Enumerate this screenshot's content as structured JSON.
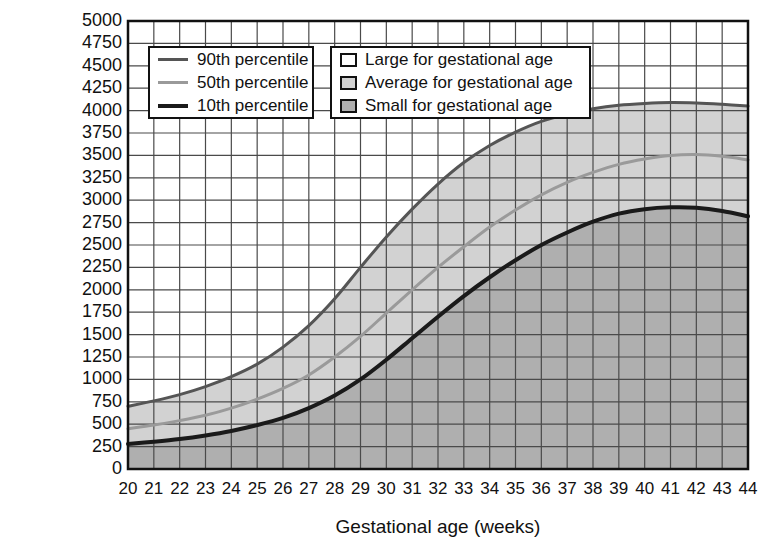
{
  "chart_data": {
    "type": "area",
    "title": "",
    "xlabel": "Gestational age (weeks)",
    "ylabel": "Birth weight (g)",
    "xlim": [
      20,
      44
    ],
    "ylim": [
      0,
      5000
    ],
    "xticks": [
      20,
      21,
      22,
      23,
      24,
      25,
      26,
      27,
      28,
      29,
      30,
      31,
      32,
      33,
      34,
      35,
      36,
      37,
      38,
      39,
      40,
      41,
      42,
      43,
      44
    ],
    "yticks": [
      0,
      250,
      500,
      750,
      1000,
      1250,
      1500,
      1750,
      2000,
      2250,
      2500,
      2750,
      3000,
      3250,
      3500,
      3750,
      4000,
      4250,
      4500,
      4750,
      5000
    ],
    "grid": true,
    "legend_position": "upper-left",
    "x": [
      20,
      21,
      22,
      23,
      24,
      25,
      26,
      27,
      28,
      29,
      30,
      31,
      32,
      33,
      34,
      35,
      36,
      37,
      38,
      39,
      40,
      41,
      42,
      43,
      44
    ],
    "series": [
      {
        "name": "90th percentile",
        "color": "#555555",
        "width": 3,
        "values": [
          700,
          760,
          830,
          920,
          1030,
          1170,
          1360,
          1600,
          1900,
          2250,
          2590,
          2900,
          3180,
          3420,
          3610,
          3760,
          3880,
          3960,
          4020,
          4060,
          4080,
          4090,
          4085,
          4070,
          4050
        ]
      },
      {
        "name": "50th percentile",
        "color": "#9a9a9a",
        "width": 3,
        "values": [
          450,
          490,
          540,
          600,
          680,
          780,
          900,
          1050,
          1250,
          1480,
          1740,
          2000,
          2250,
          2480,
          2700,
          2890,
          3060,
          3200,
          3310,
          3400,
          3460,
          3500,
          3510,
          3490,
          3450
        ]
      },
      {
        "name": "10th percentile",
        "color": "#1a1a1a",
        "width": 4,
        "values": [
          280,
          305,
          335,
          375,
          425,
          490,
          570,
          680,
          820,
          1000,
          1220,
          1460,
          1700,
          1930,
          2140,
          2330,
          2500,
          2640,
          2760,
          2850,
          2900,
          2920,
          2915,
          2880,
          2820
        ]
      }
    ],
    "bands": [
      {
        "name": "Large for gestational age",
        "fill": "#ffffff",
        "region": "above 90th percentile"
      },
      {
        "name": "Average for gestational age",
        "fill": "#d2d2d2",
        "region": "between 10th and 90th percentile"
      },
      {
        "name": "Small for gestational age",
        "fill": "#afafaf",
        "region": "below 10th percentile"
      }
    ]
  },
  "axes": {
    "y_title": "Birth weight (g)",
    "x_title": "Gestational age (weeks)"
  },
  "legend_lines": {
    "items": [
      {
        "label": "90th percentile",
        "color": "#555555",
        "thickness": "3px"
      },
      {
        "label": "50th percentile",
        "color": "#9a9a9a",
        "thickness": "3px"
      },
      {
        "label": "10th percentile",
        "color": "#1a1a1a",
        "thickness": "4px"
      }
    ]
  },
  "legend_shades": {
    "items": [
      {
        "label": "Large for gestational age",
        "swatch": "#ffffff"
      },
      {
        "label": "Average for gestational age",
        "swatch": "#d2d2d2"
      },
      {
        "label": "Small for gestational age",
        "swatch": "#afafaf"
      }
    ]
  },
  "style": {
    "plot_border": "#111111",
    "gridline": "#4a4a4a",
    "background": "#ffffff"
  }
}
